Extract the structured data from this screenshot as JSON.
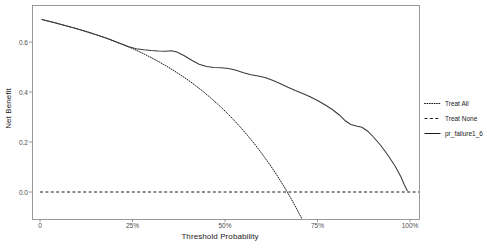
{
  "chart_data": {
    "type": "line",
    "title": "",
    "xlabel": "Threshold Probability",
    "ylabel": "Net Benefit",
    "xlim": [
      0,
      1.06
    ],
    "ylim": [
      -0.1,
      0.72
    ],
    "grid": false,
    "legend_position": "right",
    "x_tick_labels": [
      "0",
      "25%",
      "50%",
      "75%",
      "100%"
    ],
    "x_tick_values": [
      0,
      0.25,
      0.5,
      0.75,
      1.0
    ],
    "y_tick_labels": [
      "0.0",
      "0.2",
      "0.4",
      "0.6"
    ],
    "y_tick_values": [
      0.0,
      0.2,
      0.4,
      0.6
    ],
    "series": [
      {
        "name": "Treat All",
        "style": "dotted",
        "color": "#1a1a1a",
        "points": [
          [
            0.005,
            0.69
          ],
          [
            0.02,
            0.684
          ],
          [
            0.04,
            0.677
          ],
          [
            0.06,
            0.669
          ],
          [
            0.08,
            0.661
          ],
          [
            0.1,
            0.653
          ],
          [
            0.12,
            0.644
          ],
          [
            0.14,
            0.635
          ],
          [
            0.16,
            0.625
          ],
          [
            0.18,
            0.615
          ],
          [
            0.2,
            0.604
          ],
          [
            0.22,
            0.592
          ],
          [
            0.24,
            0.58
          ],
          [
            0.26,
            0.567
          ],
          [
            0.28,
            0.553
          ],
          [
            0.3,
            0.538
          ],
          [
            0.32,
            0.522
          ],
          [
            0.34,
            0.505
          ],
          [
            0.36,
            0.487
          ],
          [
            0.38,
            0.468
          ],
          [
            0.4,
            0.448
          ],
          [
            0.42,
            0.426
          ],
          [
            0.44,
            0.403
          ],
          [
            0.46,
            0.378
          ],
          [
            0.48,
            0.352
          ],
          [
            0.5,
            0.324
          ],
          [
            0.52,
            0.294
          ],
          [
            0.54,
            0.262
          ],
          [
            0.56,
            0.228
          ],
          [
            0.58,
            0.192
          ],
          [
            0.6,
            0.153
          ],
          [
            0.62,
            0.112
          ],
          [
            0.64,
            0.068
          ],
          [
            0.66,
            0.021
          ],
          [
            0.68,
            -0.03
          ],
          [
            0.7,
            -0.085
          ],
          [
            0.715,
            -0.128
          ]
        ]
      },
      {
        "name": "Treat None",
        "style": "dashed",
        "color": "#1a1a1a",
        "points": [
          [
            0.0,
            0.0
          ],
          [
            1.06,
            0.0
          ]
        ]
      },
      {
        "name": "pr_failure1_6",
        "style": "solid",
        "color": "#3a3a3a",
        "points": [
          [
            0.005,
            0.69
          ],
          [
            0.03,
            0.681
          ],
          [
            0.06,
            0.669
          ],
          [
            0.09,
            0.657
          ],
          [
            0.12,
            0.644
          ],
          [
            0.15,
            0.63
          ],
          [
            0.18,
            0.615
          ],
          [
            0.21,
            0.598
          ],
          [
            0.24,
            0.581
          ],
          [
            0.26,
            0.573
          ],
          [
            0.28,
            0.569
          ],
          [
            0.3,
            0.566
          ],
          [
            0.32,
            0.564
          ],
          [
            0.34,
            0.563
          ],
          [
            0.355,
            0.565
          ],
          [
            0.37,
            0.56
          ],
          [
            0.39,
            0.545
          ],
          [
            0.41,
            0.527
          ],
          [
            0.43,
            0.511
          ],
          [
            0.45,
            0.502
          ],
          [
            0.47,
            0.498
          ],
          [
            0.49,
            0.497
          ],
          [
            0.51,
            0.494
          ],
          [
            0.53,
            0.487
          ],
          [
            0.55,
            0.477
          ],
          [
            0.57,
            0.469
          ],
          [
            0.59,
            0.464
          ],
          [
            0.61,
            0.457
          ],
          [
            0.63,
            0.446
          ],
          [
            0.65,
            0.433
          ],
          [
            0.67,
            0.419
          ],
          [
            0.69,
            0.406
          ],
          [
            0.71,
            0.394
          ],
          [
            0.73,
            0.381
          ],
          [
            0.75,
            0.366
          ],
          [
            0.77,
            0.349
          ],
          [
            0.79,
            0.33
          ],
          [
            0.81,
            0.307
          ],
          [
            0.825,
            0.285
          ],
          [
            0.84,
            0.27
          ],
          [
            0.855,
            0.264
          ],
          [
            0.87,
            0.259
          ],
          [
            0.885,
            0.244
          ],
          [
            0.9,
            0.222
          ],
          [
            0.92,
            0.188
          ],
          [
            0.94,
            0.148
          ],
          [
            0.96,
            0.103
          ],
          [
            0.975,
            0.062
          ],
          [
            0.985,
            0.028
          ],
          [
            0.993,
            0.004
          ]
        ]
      }
    ]
  },
  "legend": {
    "items": [
      {
        "label": "Treat All",
        "style": "dotted"
      },
      {
        "label": "Treat None",
        "style": "dashed"
      },
      {
        "label": "pr_failure1_6",
        "style": "solid"
      }
    ]
  },
  "caption": ""
}
